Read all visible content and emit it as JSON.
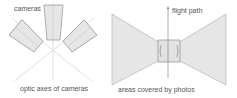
{
  "left_panel": {
    "label_cameras": "cameras",
    "caption": "optic axes of cameras"
  },
  "right_panel": {
    "label_flight_path": "flight path",
    "caption": "areas covered by photos"
  },
  "colors": {
    "fill": "#e6e6e6",
    "stroke": "#9a9a9a",
    "axis_line": "#d0d0d0",
    "text": "#555555"
  }
}
